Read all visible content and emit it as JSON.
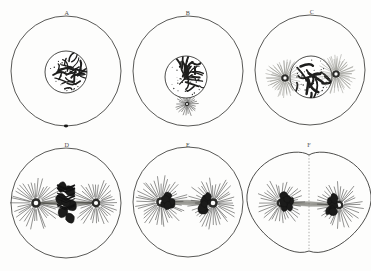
{
  "figure": {
    "background_color": "#fdfdfc",
    "ink_color": "#3a3a38",
    "panel_rows": 2,
    "panel_cols": 3,
    "width": 371,
    "height": 271
  },
  "panels": [
    {
      "id": "panel-a",
      "label": "A",
      "label_x": 67,
      "label_y": 15,
      "stage_name": "resting-nucleus",
      "cell": {
        "cx": 66,
        "cy": 71,
        "rx": 55,
        "ry": 55
      },
      "nucleus": {
        "cx": 66,
        "cy": 72,
        "r": 21,
        "chromatin": "spireme-tangle"
      },
      "asters": [],
      "centrosome_marks": [
        {
          "x": 66,
          "y": 126
        }
      ],
      "divided": false
    },
    {
      "id": "panel-b",
      "label": "B",
      "label_x": 188,
      "label_y": 15,
      "stage_name": "centrosome-appears",
      "cell": {
        "cx": 188,
        "cy": 71,
        "rx": 55,
        "ry": 55
      },
      "nucleus": {
        "cx": 186,
        "cy": 77,
        "r": 21,
        "chromatin": "spireme-tangle"
      },
      "asters": [
        {
          "cx": 187,
          "cy": 104,
          "r": 11,
          "rays": 26,
          "weight": "dense"
        }
      ],
      "centrosome_marks": [],
      "divided": false
    },
    {
      "id": "panel-c",
      "label": "C",
      "label_x": 312,
      "label_y": 14,
      "stage_name": "two-asters-prophase",
      "cell": {
        "cx": 310,
        "cy": 70,
        "rx": 55,
        "ry": 55
      },
      "nucleus": {
        "cx": 311,
        "cy": 77,
        "r": 21,
        "chromatin": "coarse-threads"
      },
      "asters": [
        {
          "cx": 285,
          "cy": 78,
          "r": 18,
          "rays": 30,
          "weight": "light"
        },
        {
          "cx": 336,
          "cy": 74,
          "r": 18,
          "rays": 30,
          "weight": "light"
        }
      ],
      "centrosome_marks": [],
      "divided": false
    },
    {
      "id": "panel-d",
      "label": "D",
      "label_x": 67,
      "label_y": 147,
      "stage_name": "metaphase-spindle",
      "cell": {
        "cx": 66,
        "cy": 203,
        "rx": 55,
        "ry": 55
      },
      "nucleus": null,
      "asters": [
        {
          "cx": 36,
          "cy": 203,
          "r": 24,
          "rays": 38,
          "weight": "dense"
        },
        {
          "cx": 96,
          "cy": 203,
          "r": 22,
          "rays": 36,
          "weight": "dense"
        }
      ],
      "spindle": {
        "x1": 36,
        "y1": 203,
        "x2": 96,
        "y2": 203,
        "fibers": 13
      },
      "chromosomes": "v-shaped-equatorial-plate",
      "divided": false
    },
    {
      "id": "panel-e",
      "label": "E",
      "label_x": 188,
      "label_y": 147,
      "stage_name": "anaphase-separation",
      "cell": {
        "cx": 188,
        "cy": 202,
        "rx": 55,
        "ry": 55
      },
      "nucleus": null,
      "asters": [
        {
          "cx": 161,
          "cy": 202,
          "r": 24,
          "rays": 40,
          "weight": "dense"
        },
        {
          "cx": 213,
          "cy": 203,
          "r": 24,
          "rays": 40,
          "weight": "dense"
        }
      ],
      "spindle": {
        "x1": 161,
        "y1": 202,
        "x2": 213,
        "y2": 203,
        "fibers": 11
      },
      "chromosomes": "daughter-groups-at-poles",
      "divided": false
    },
    {
      "id": "panel-f",
      "label": "F",
      "label_x": 309,
      "label_y": 147,
      "stage_name": "cytokinesis-cleavage",
      "cell": {
        "cx": 309,
        "cy": 203,
        "rx": 62,
        "ry": 55
      },
      "nucleus": null,
      "asters": [
        {
          "cx": 281,
          "cy": 203,
          "r": 22,
          "rays": 34,
          "weight": "dense"
        },
        {
          "cx": 339,
          "cy": 205,
          "r": 22,
          "rays": 34,
          "weight": "dense"
        }
      ],
      "spindle": {
        "x1": 281,
        "y1": 203,
        "x2": 339,
        "y2": 205,
        "fibers": 11
      },
      "chromosomes": "daughter-groups-at-poles",
      "divided": true,
      "cleavage_line_x": 309
    }
  ],
  "legend": {
    "note": ""
  }
}
